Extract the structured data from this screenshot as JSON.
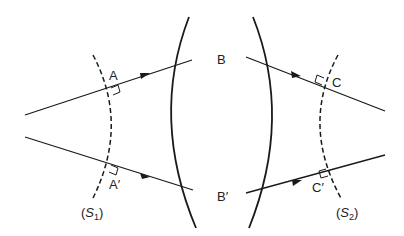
{
  "diagram": {
    "type": "wavefront-lens",
    "colors": {
      "stroke": "#1a1a1a",
      "background": "#ffffff"
    },
    "labels": {
      "A": "A",
      "A_prime": "A′",
      "B": "B",
      "B_prime": "B′",
      "C": "C",
      "C_prime": "C′",
      "S1_open": "(",
      "S1_var": "S",
      "S1_sub": "1",
      "S1_close": ")",
      "S2_open": "(",
      "S2_var": "S",
      "S2_sub": "2",
      "S2_close": ")"
    },
    "elements": [
      "incident wavefront S1 (dashed)",
      "lens surfaces (two solid arcs)",
      "emergent wavefront S2 (dashed)",
      "4 rays with arrows",
      "right-angle markers at A, A′, C, C′"
    ]
  }
}
